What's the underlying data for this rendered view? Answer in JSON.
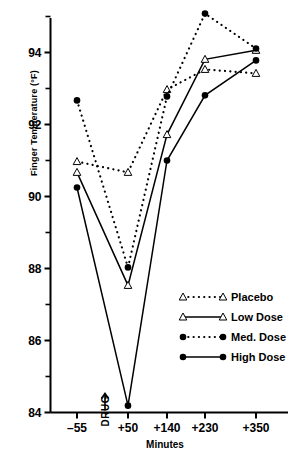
{
  "chart_data": {
    "type": "line",
    "title": "",
    "xlabel": "Minutes",
    "ylabel": "Finger Temperature (°F)",
    "x": [
      -55,
      50,
      140,
      230,
      350
    ],
    "xtick_labels": [
      "–55",
      "+50",
      "+140",
      "+230",
      "+350"
    ],
    "ytick_labels": [
      "84",
      "86",
      "88",
      "90",
      "92",
      "94"
    ],
    "ytick_values": [
      84,
      86,
      88,
      90,
      92,
      94
    ],
    "yticks_minor": [
      85,
      87,
      89,
      91,
      93,
      95
    ],
    "ylim": [
      84,
      95.3
    ],
    "xlim": [
      -90,
      420
    ],
    "grid": false,
    "legend_position": "center-right",
    "annotations": [
      {
        "text": "DRUG",
        "x": -5,
        "y": 84,
        "marker": "up-arrow"
      }
    ],
    "series": [
      {
        "name": "Placebo",
        "marker": "open-triangle",
        "line": "dotted",
        "values": [
          90.97,
          90.67,
          92.97,
          93.53,
          93.42
        ]
      },
      {
        "name": "Low Dose",
        "marker": "open-triangle",
        "line": "solid",
        "values": [
          90.67,
          87.53,
          91.72,
          93.81,
          94.06
        ]
      },
      {
        "name": "Med. Dose",
        "marker": "filled-circle",
        "line": "dotted",
        "values": [
          92.67,
          88.03,
          92.78,
          95.08,
          94.11
        ]
      },
      {
        "name": "High Dose",
        "marker": "filled-circle",
        "line": "solid",
        "values": [
          90.25,
          84.19,
          91.0,
          92.81,
          93.78
        ]
      }
    ]
  },
  "legend": {
    "items": [
      {
        "label": "Placebo"
      },
      {
        "label": "Low Dose"
      },
      {
        "label": "Med. Dose"
      },
      {
        "label": "High Dose"
      }
    ]
  },
  "axes": {
    "y_title": "Finger Temperature (°F)",
    "x_title": "Minutes",
    "drug_marker_label": "DRUG"
  }
}
